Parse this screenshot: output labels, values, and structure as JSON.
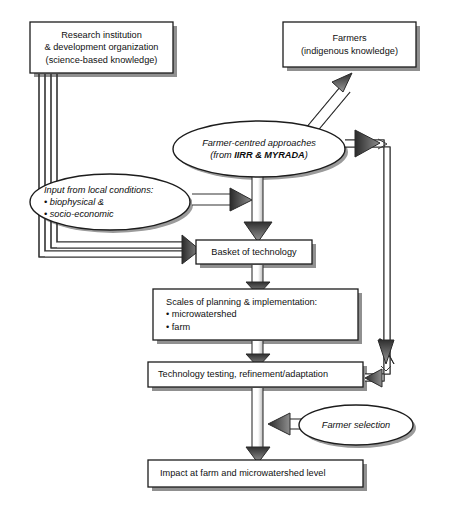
{
  "figure": {
    "kind": "flow-diagram",
    "background": "#ffffff",
    "line_color": "#1a1a1a",
    "shadow_color": "#8c8c8c",
    "fill_color": "#ffffff"
  },
  "nodes": {
    "research": {
      "shape": "rectangle",
      "line1": "Research institution",
      "line2": "& development organization",
      "line3": "(science-based knowledge)"
    },
    "farmers": {
      "shape": "rectangle",
      "line1": "Farmers",
      "line2": "(indigenous knowledge)"
    },
    "approaches": {
      "shape": "ellipse",
      "line1": "Farmer-centred approaches",
      "line2_prefix": "(from ",
      "line2_bold": "IIRR & MYRADA",
      "line2_suffix": ")"
    },
    "inputs": {
      "shape": "ellipse",
      "line1": "Input from local conditions:",
      "line2": "• biophysical &",
      "line3": "• socio-economic"
    },
    "basket": {
      "shape": "rectangle",
      "line1": "Basket of technology"
    },
    "scales": {
      "shape": "rectangle",
      "line1": "Scales of planning & implementation:",
      "line2": "• microwatershed",
      "line3": "• farm"
    },
    "testing": {
      "shape": "rectangle",
      "line1": "Technology testing, refinement/adaptation"
    },
    "selection": {
      "shape": "ellipse",
      "line1": "Farmer selection"
    },
    "impact": {
      "shape": "rectangle",
      "line1": "Impact at farm and microwatershed level"
    }
  },
  "edges": [
    {
      "id": "research-to-basket",
      "from": "research",
      "to": "basket",
      "style": "outlined-elbow-arrow"
    },
    {
      "id": "research-to-basket-outer",
      "from": "research",
      "to": "basket",
      "style": "outlined-elbow-arrow"
    },
    {
      "id": "farmers-approaches",
      "from": "farmers",
      "to": "approaches",
      "style": "double-headed-arrow"
    },
    {
      "id": "approaches-to-basket",
      "from": "approaches",
      "to": "basket",
      "style": "outlined-arrow"
    },
    {
      "id": "inputs-to-trunk",
      "from": "inputs",
      "to": "approaches-trunk",
      "style": "outlined-arrow"
    },
    {
      "id": "approaches-to-testing-loop",
      "from": "approaches",
      "to": "testing",
      "style": "outlined-elbow-arrow"
    },
    {
      "id": "basket-to-scales",
      "from": "basket",
      "to": "scales",
      "style": "outlined-arrow"
    },
    {
      "id": "scales-to-testing",
      "from": "scales",
      "to": "testing",
      "style": "outlined-arrow"
    },
    {
      "id": "selection-to-trunk",
      "from": "selection",
      "to": "testing-trunk",
      "style": "outlined-arrow"
    },
    {
      "id": "testing-to-impact",
      "from": "testing",
      "to": "impact",
      "style": "outlined-arrow"
    }
  ]
}
